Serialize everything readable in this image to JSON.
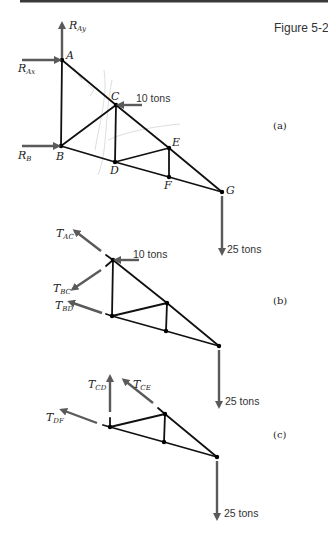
{
  "figure": {
    "title": "Figure 5-2",
    "top_rule": {
      "x1": 20,
      "x2": 328,
      "y": 1,
      "color": "#3a3a3a"
    },
    "force_color": "#5a5a5a",
    "member_color": "#111111"
  },
  "panels": [
    {
      "id": "a",
      "label": "(a)",
      "label_pos": [
        273,
        129
      ],
      "nodes": {
        "A": [
          62,
          60
        ],
        "B": [
          61,
          146
        ],
        "C": [
          116,
          105
        ],
        "D": [
          115,
          162
        ],
        "E": [
          169,
          148
        ],
        "F": [
          169,
          177
        ],
        "G": [
          222,
          192
        ]
      },
      "node_labels": [
        {
          "text": "A",
          "x": 66,
          "y": 59
        },
        {
          "text": "B",
          "x": 56,
          "y": 160
        },
        {
          "text": "C",
          "x": 111,
          "y": 100
        },
        {
          "text": "D",
          "x": 110,
          "y": 174
        },
        {
          "text": "E",
          "x": 172,
          "y": 146
        },
        {
          "text": "F",
          "x": 164,
          "y": 189
        },
        {
          "text": "G",
          "x": 226,
          "y": 194
        }
      ],
      "members": [
        [
          "A",
          "B"
        ],
        [
          "A",
          "C"
        ],
        [
          "C",
          "E"
        ],
        [
          "E",
          "G"
        ],
        [
          "B",
          "C"
        ],
        [
          "C",
          "D"
        ],
        [
          "B",
          "D"
        ],
        [
          "D",
          "F"
        ],
        [
          "F",
          "G"
        ],
        [
          "D",
          "E"
        ],
        [
          "E",
          "F"
        ]
      ],
      "cut_members": [],
      "forces": [
        {
          "name": "R",
          "sub": "Ay",
          "from": [
            62,
            58
          ],
          "to": [
            62,
            24
          ],
          "label_pos": [
            69,
            29
          ]
        },
        {
          "name": "R",
          "sub": "Ax",
          "from": [
            22,
            60
          ],
          "to": [
            59,
            60
          ],
          "label_pos": [
            18,
            72
          ]
        },
        {
          "name": "R",
          "sub": "B",
          "from": [
            22,
            146
          ],
          "to": [
            58,
            146
          ],
          "label_pos": [
            18,
            159
          ]
        },
        {
          "plain": "10 tons",
          "from": [
            142,
            105
          ],
          "to": [
            119,
            105
          ],
          "label_pos": [
            136,
            102
          ]
        },
        {
          "plain": "25 tons",
          "from": [
            222,
            196
          ],
          "to": [
            222,
            253
          ],
          "label_pos": [
            227,
            253
          ]
        }
      ]
    },
    {
      "id": "b",
      "label": "(b)",
      "label_pos": [
        273,
        304
      ],
      "nodes": {
        "C": [
          113,
          260
        ],
        "D": [
          112,
          316
        ],
        "E": [
          167,
          303
        ],
        "F": [
          166,
          331
        ],
        "G": [
          219,
          346
        ]
      },
      "node_labels": [],
      "members": [
        [
          "C",
          "D"
        ],
        [
          "C",
          "E"
        ],
        [
          "E",
          "G"
        ],
        [
          "D",
          "E"
        ],
        [
          "E",
          "F"
        ],
        [
          "D",
          "F"
        ],
        [
          "F",
          "G"
        ]
      ],
      "cut_members": [
        {
          "from": [
            113,
            260
          ],
          "to": [
            106,
            255
          ]
        },
        {
          "from": [
            113,
            260
          ],
          "to": [
            106,
            266
          ]
        },
        {
          "from": [
            112,
            316
          ],
          "to": [
            106,
            314
          ]
        }
      ],
      "forces": [
        {
          "name": "T",
          "sub": "AC",
          "from": [
            101,
            251
          ],
          "to": [
            75,
            231
          ],
          "label_pos": [
            56,
            237
          ]
        },
        {
          "name": "T",
          "sub": "BC",
          "from": [
            101,
            270
          ],
          "to": [
            73,
            289
          ],
          "label_pos": [
            53,
            292
          ]
        },
        {
          "name": "T",
          "sub": "BD",
          "from": [
            102,
            313
          ],
          "to": [
            70,
            302
          ],
          "label_pos": [
            55,
            309
          ]
        },
        {
          "plain": "10 tons",
          "from": [
            139,
            260
          ],
          "to": [
            116,
            260
          ],
          "label_pos": [
            133,
            258
          ]
        },
        {
          "plain": "25 tons",
          "from": [
            219,
            350
          ],
          "to": [
            219,
            406
          ],
          "label_pos": [
            225,
            405
          ]
        }
      ]
    },
    {
      "id": "c",
      "label": "(c)",
      "label_pos": [
        273,
        438
      ],
      "nodes": {
        "D": [
          110,
          427
        ],
        "E": [
          165,
          414
        ],
        "F": [
          164,
          442
        ],
        "G": [
          217,
          457
        ]
      },
      "node_labels": [],
      "members": [
        [
          "D",
          "E"
        ],
        [
          "E",
          "G"
        ],
        [
          "E",
          "F"
        ],
        [
          "D",
          "F"
        ],
        [
          "F",
          "G"
        ]
      ],
      "cut_members": [
        {
          "from": [
            110,
            427
          ],
          "to": [
            110,
            418
          ]
        },
        {
          "from": [
            165,
            414
          ],
          "to": [
            158,
            408
          ]
        },
        {
          "from": [
            110,
            427
          ],
          "to": [
            103,
            425
          ]
        }
      ],
      "forces": [
        {
          "name": "T",
          "sub": "CD",
          "from": [
            110,
            412
          ],
          "to": [
            110,
            377
          ],
          "label_pos": [
            88,
            388
          ]
        },
        {
          "name": "T",
          "sub": "CE",
          "from": [
            153,
            403
          ],
          "to": [
            124,
            380
          ],
          "label_pos": [
            133,
            388
          ]
        },
        {
          "name": "T",
          "sub": "DF",
          "from": [
            97,
            423
          ],
          "to": [
            62,
            410
          ],
          "label_pos": [
            46,
            421
          ]
        },
        {
          "plain": "25 tons",
          "from": [
            217,
            461
          ],
          "to": [
            217,
            518
          ],
          "label_pos": [
            224,
            517
          ]
        }
      ]
    }
  ]
}
